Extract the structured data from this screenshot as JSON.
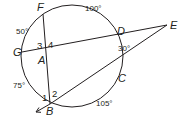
{
  "diagram": {
    "type": "circle-secant-chord-figure",
    "colors": {
      "stroke": "#231f20",
      "text": "#231f20",
      "background": "#ffffff"
    },
    "circle": {
      "cx": 72,
      "cy": 56,
      "r": 51
    },
    "points": {
      "F": {
        "label": "F",
        "x": 43,
        "y": 14
      },
      "G": {
        "label": "G",
        "x": 22,
        "y": 52
      },
      "A": {
        "label": "A",
        "x": 45,
        "y": 54
      },
      "D": {
        "label": "D",
        "x": 117,
        "y": 38
      },
      "E": {
        "label": "E",
        "x": 167,
        "y": 25
      },
      "C": {
        "label": "C",
        "x": 116,
        "y": 74
      },
      "B": {
        "label": "B",
        "x": 50,
        "y": 104
      }
    },
    "arc_labels": {
      "FD": "100°",
      "GF": "50°",
      "DC": "30°",
      "GB": "75°",
      "BC": "105°"
    },
    "angle_labels": {
      "a1": "1",
      "a2": "2",
      "a3": "3",
      "a4": "4"
    }
  }
}
